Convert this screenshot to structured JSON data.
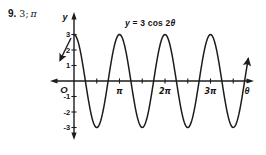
{
  "problem": {
    "number": "9.",
    "answer_value": "3;",
    "answer_period": "π",
    "answer": "3; π"
  },
  "chart_data": {
    "type": "line",
    "title": "y = 3 cos 2θ",
    "title_parts": {
      "y": "y",
      "mid": " = 3 cos 2",
      "theta": "θ"
    },
    "equation": "y = 3 cos 2θ",
    "xlabel": "θ",
    "ylabel": "y",
    "origin_label": "O",
    "amplitude": 3,
    "frequency": 2,
    "period_pi": 1,
    "theta_domain_pi": [
      0,
      3.83
    ],
    "ylim": [
      -3,
      3
    ],
    "y_ticks": [
      3,
      2,
      1,
      -1,
      -2,
      -3
    ],
    "x_tick_step_pi": 0.5,
    "x_tick_count": 7,
    "x_tick_labels": [
      {
        "pi": 1,
        "label": "π"
      },
      {
        "pi": 2,
        "label": "2π"
      },
      {
        "pi": 3,
        "label": "3π"
      }
    ],
    "grid": false,
    "legend": false,
    "line_color": "#1c1c1c",
    "axis_color": "#1c1c1c"
  }
}
